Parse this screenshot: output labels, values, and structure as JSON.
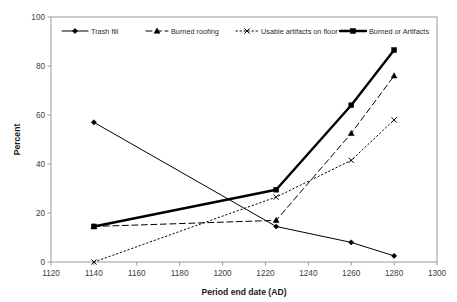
{
  "chart_data": {
    "type": "line",
    "title": "",
    "xlabel": "Period end date (AD)",
    "ylabel": "Percent",
    "xlim": [
      1120,
      1300
    ],
    "ylim": [
      0,
      100
    ],
    "xticks": [
      1120,
      1140,
      1160,
      1180,
      1200,
      1220,
      1240,
      1260,
      1280,
      1300
    ],
    "yticks": [
      0,
      20,
      40,
      60,
      80,
      100
    ],
    "grid": false,
    "legend_position": "top-inside",
    "x": [
      1140,
      1225,
      1260,
      1280
    ],
    "series": [
      {
        "name": "Trash fill",
        "values": [
          57,
          14.5,
          8,
          2.5
        ],
        "marker": "diamond",
        "line_style": "solid",
        "line_width": 1,
        "color": "#000000"
      },
      {
        "name": "Burned roofing",
        "values": [
          14.5,
          17,
          52.5,
          76
        ],
        "marker": "triangle",
        "line_style": "dashed",
        "line_width": 1,
        "color": "#000000"
      },
      {
        "name": "Usable artifacts on floor",
        "values": [
          0,
          26.5,
          41.5,
          58
        ],
        "marker": "cross",
        "line_style": "dotted",
        "line_width": 1,
        "color": "#000000"
      },
      {
        "name": "Burned or Artifacts",
        "values": [
          14.5,
          29.5,
          64,
          86.5
        ],
        "marker": "square",
        "line_style": "solid",
        "line_width": 2.4,
        "color": "#000000"
      }
    ]
  },
  "axes": {
    "y_label": "Percent",
    "x_label": "Period end date (AD)",
    "y_tick_labels": [
      "0",
      "20",
      "40",
      "60",
      "80",
      "100"
    ],
    "x_tick_labels": [
      "1120",
      "1140",
      "1160",
      "1180",
      "1200",
      "1220",
      "1240",
      "1260",
      "1280",
      "1300"
    ]
  },
  "legend": {
    "entries": [
      {
        "label": "Trash fill"
      },
      {
        "label": "Burned roofing"
      },
      {
        "label": "Usable artifacts on floor"
      },
      {
        "label": "Burned or Artifacts"
      }
    ]
  },
  "style": {
    "plot_border_color": "#9a9a9a",
    "background": "#ffffff",
    "ink": "#000000"
  }
}
